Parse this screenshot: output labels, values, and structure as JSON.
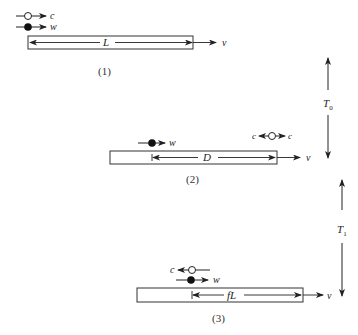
{
  "diagram": {
    "type": "physics-kinematics",
    "panels": [
      {
        "caption": "(1)",
        "length_label": "L",
        "velocity_label": "v",
        "particles": [
          {
            "kind": "hollow",
            "label": "c",
            "direction": "right"
          },
          {
            "kind": "filled",
            "label": "w",
            "direction": "right"
          }
        ]
      },
      {
        "caption": "(2)",
        "length_label": "D",
        "velocity_label": "v",
        "particles": [
          {
            "kind": "filled",
            "label": "w",
            "direction": "right"
          },
          {
            "kind": "hollow",
            "label_left": "c",
            "label_right": "c",
            "direction": "both"
          }
        ]
      },
      {
        "caption": "(3)",
        "length_label": "fL",
        "velocity_label": "v",
        "particles": [
          {
            "kind": "hollow",
            "label": "c",
            "direction": "left"
          },
          {
            "kind": "filled",
            "label": "w",
            "direction": "right"
          }
        ]
      }
    ],
    "intervals": [
      {
        "label": "T",
        "subscript": "0",
        "between": [
          "(1)",
          "(2)"
        ]
      },
      {
        "label": "T",
        "subscript": "1",
        "between": [
          "(2)",
          "(3)"
        ]
      }
    ]
  }
}
